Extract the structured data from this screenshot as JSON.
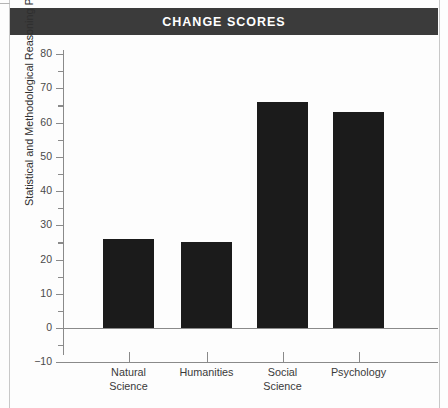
{
  "figure": {
    "title": "CHANGE SCORES",
    "title_bar_color": "#3b3b3b",
    "title_text_color": "#ffffff",
    "background": "#fdfdfd"
  },
  "chart_data": {
    "type": "bar",
    "title": "CHANGE SCORES",
    "xlabel": "",
    "ylabel": "Statistical and Methodological Reasoning Percent Gain",
    "categories": [
      "Natural\nScience",
      "Humanities",
      "Social\nScience",
      "Psychology"
    ],
    "values": [
      26,
      25,
      66,
      63
    ],
    "ylim": [
      -10,
      82
    ],
    "yticks": [
      -10,
      0,
      10,
      20,
      30,
      40,
      50,
      60,
      70,
      80
    ],
    "ytick_labels": [
      "−10",
      "0",
      "10",
      "20",
      "30",
      "40",
      "50",
      "60",
      "70",
      "80"
    ],
    "yticks_minor": [
      -5,
      5,
      15,
      25,
      35,
      45,
      55,
      65,
      75
    ],
    "grid": false,
    "legend": null,
    "bar_color": "#1b1b1b",
    "axis_color": "#8a8a8a"
  }
}
